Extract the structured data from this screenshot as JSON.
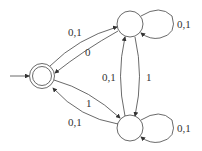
{
  "diagram": {
    "type": "finite automaton",
    "states": [
      {
        "id": "q0",
        "start": true,
        "accepting": true
      },
      {
        "id": "q1",
        "start": false,
        "accepting": false
      },
      {
        "id": "q2",
        "start": false,
        "accepting": false
      }
    ],
    "transitions": [
      {
        "from": "q0",
        "to": "q1",
        "label": "0,1"
      },
      {
        "from": "q1",
        "to": "q0",
        "label": "0"
      },
      {
        "from": "q0",
        "to": "q2",
        "label": "1"
      },
      {
        "from": "q2",
        "to": "q0",
        "label": "0,1"
      },
      {
        "from": "q1",
        "to": "q1",
        "label": "0,1"
      },
      {
        "from": "q2",
        "to": "q2",
        "label": "0,1"
      },
      {
        "from": "q2",
        "to": "q1",
        "label": "0,1"
      },
      {
        "from": "q1",
        "to": "q2",
        "label": "1"
      }
    ]
  },
  "labels": {
    "q0_q1": "0,1",
    "q1_q0": "0",
    "q0_q2": "1",
    "q2_q0": "0,1",
    "q1_loop": "0,1",
    "q2_loop": "0,1",
    "q2_q1": "0,1",
    "q1_q2": "1"
  }
}
